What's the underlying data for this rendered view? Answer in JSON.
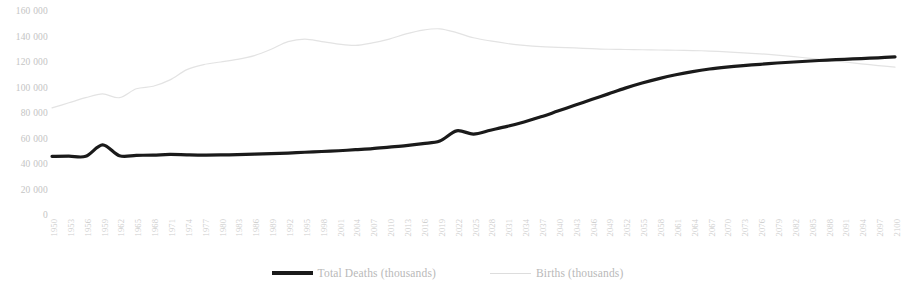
{
  "chart_data": {
    "type": "line",
    "title": "",
    "xlabel": "",
    "ylabel": "",
    "grid": false,
    "legend_position": "bottom",
    "ylim": [
      0,
      160000
    ],
    "xlim": [
      1950,
      2100
    ],
    "y_ticks": [
      "0",
      "20 000",
      "40 000",
      "60 000",
      "80 000",
      "100 000",
      "120 000",
      "140 000",
      "160 000"
    ],
    "y_tick_values": [
      0,
      20000,
      40000,
      60000,
      80000,
      100000,
      120000,
      140000,
      160000
    ],
    "categories": [
      "1950",
      "1953",
      "1956",
      "1959",
      "1962",
      "1965",
      "1968",
      "1971",
      "1974",
      "1977",
      "1980",
      "1983",
      "1986",
      "1989",
      "1992",
      "1995",
      "1998",
      "2001",
      "2004",
      "2007",
      "2010",
      "2013",
      "2016",
      "2019",
      "2022",
      "2025",
      "2028",
      "2031",
      "2034",
      "2037",
      "2040",
      "2043",
      "2046",
      "2049",
      "2052",
      "2055",
      "2058",
      "2061",
      "2064",
      "2067",
      "2070",
      "2073",
      "2076",
      "2079",
      "2082",
      "2085",
      "2088",
      "2091",
      "2094",
      "2097",
      "2100"
    ],
    "series": [
      {
        "name": "Total Deaths (thousands)",
        "color": "#1a1a1a",
        "width": 3.2,
        "values": [
          46000,
          46200,
          46000,
          55000,
          46500,
          46800,
          47000,
          47500,
          47200,
          47000,
          47100,
          47400,
          47800,
          48200,
          48600,
          49200,
          49800,
          50400,
          51200,
          52000,
          53200,
          54400,
          56000,
          58000,
          66000,
          63500,
          66500,
          69500,
          73000,
          77000,
          81500,
          86000,
          90500,
          95000,
          99500,
          103500,
          107000,
          110000,
          112500,
          114500,
          116000,
          117200,
          118200,
          119200,
          120000,
          120800,
          121500,
          122100,
          122700,
          123300,
          124000
        ]
      },
      {
        "name": "Births (thousands)",
        "color": "#e3e3e3",
        "width": 1.2,
        "values": [
          84000,
          88000,
          92000,
          95000,
          92000,
          99000,
          101000,
          106000,
          114000,
          118000,
          120000,
          122000,
          125000,
          130000,
          136000,
          138000,
          136000,
          134000,
          133000,
          135000,
          138000,
          142000,
          145000,
          146000,
          143000,
          139000,
          136500,
          134500,
          133000,
          132000,
          131500,
          131000,
          130500,
          130000,
          129800,
          129600,
          129400,
          129200,
          129000,
          128600,
          128000,
          127200,
          126400,
          125400,
          124200,
          122800,
          121400,
          120000,
          118600,
          117200,
          116000
        ]
      }
    ]
  },
  "legend": {
    "items": [
      {
        "label": "Total Deaths (thousands)",
        "swatch": "thick-black-line"
      },
      {
        "label": "Births (thousands)",
        "swatch": "thin-gray-line"
      }
    ]
  }
}
